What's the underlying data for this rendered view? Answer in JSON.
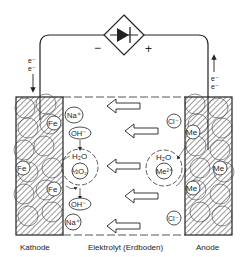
{
  "diagram": {
    "colors": {
      "ink": "#222222",
      "background": "#ffffff"
    },
    "power_source": {
      "icon": "diode-rectifier-icon",
      "minus": "−",
      "plus": "+"
    },
    "electron_flow": {
      "left": [
        "e⁻",
        "e⁻"
      ],
      "right": [
        "e⁻",
        "e⁻"
      ]
    },
    "cathode": {
      "label": "Kathode",
      "atoms": [
        "Fe",
        "Fe",
        "Fe"
      ],
      "ions": [
        "Na⁺",
        "OH⁻",
        "H₂O",
        "½O₂",
        "OH⁻",
        "Na⁺"
      ]
    },
    "electrolyte": {
      "label": "Elektrolyt (Erdboden)",
      "arrow_count": 5
    },
    "anode": {
      "label": "Anode",
      "atoms": [
        "Me",
        "Me",
        "Me"
      ],
      "ions": [
        "Cl⁻",
        "H₂O",
        "Me²⁺",
        "Cl⁻"
      ]
    }
  }
}
